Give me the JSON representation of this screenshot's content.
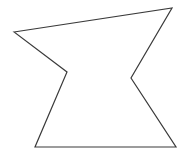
{
  "canvas": {
    "width": 193,
    "height": 164,
    "background_color": "#ffffff",
    "description": "line-drawing of a single concave hexagonal polygon"
  },
  "shape": {
    "name": "concave-hexagon",
    "kind": "polygon",
    "vertex_count": 6,
    "closed": true,
    "fill": "none",
    "stroke_color": "#3a3a3a",
    "stroke_width": 1.2,
    "points": "14,32 172,8 131,78 176,147 35,147 67,72",
    "vertices": [
      {
        "label": "top-left",
        "x": 14,
        "y": 32
      },
      {
        "label": "top-right",
        "x": 172,
        "y": 8
      },
      {
        "label": "right-notch",
        "x": 131,
        "y": 78
      },
      {
        "label": "bottom-right",
        "x": 176,
        "y": 147
      },
      {
        "label": "bottom-left",
        "x": 35,
        "y": 147
      },
      {
        "label": "left-notch",
        "x": 67,
        "y": 72
      }
    ],
    "edges": [
      {
        "from": "top-left",
        "to": "top-right"
      },
      {
        "from": "top-right",
        "to": "right-notch"
      },
      {
        "from": "right-notch",
        "to": "bottom-right"
      },
      {
        "from": "bottom-right",
        "to": "bottom-left"
      },
      {
        "from": "bottom-left",
        "to": "left-notch"
      },
      {
        "from": "left-notch",
        "to": "top-left"
      }
    ]
  }
}
